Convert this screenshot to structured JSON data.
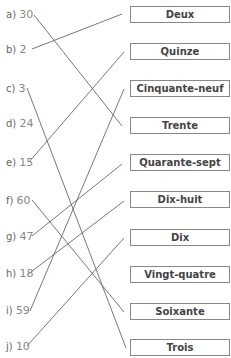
{
  "left_items": [
    {
      "label": "a)",
      "value": "30"
    },
    {
      "label": "b)",
      "value": "2"
    },
    {
      "label": "c)",
      "value": "3"
    },
    {
      "label": "d)",
      "value": "24"
    },
    {
      "label": "e)",
      "value": "15"
    },
    {
      "label": "f)",
      "value": "60"
    },
    {
      "label": "g)",
      "value": "47"
    },
    {
      "label": "h)",
      "value": "18"
    },
    {
      "label": "i)",
      "value": "59"
    },
    {
      "label": "j)",
      "value": "10"
    }
  ],
  "right_boxes": [
    "Deux",
    "Quinze",
    "Cinquante-neuf",
    "Trente",
    "Quarante-sept",
    "Dix-huit",
    "Dix",
    "Vingt-quatre",
    "Soixante",
    "Trois"
  ],
  "connections": [
    {
      "from": "a",
      "to": "Trente"
    },
    {
      "from": "b",
      "to": "Deux"
    },
    {
      "from": "c",
      "to": "Trois"
    },
    {
      "from": "e",
      "to": "Quinze"
    },
    {
      "from": "f",
      "to": "Soixante"
    },
    {
      "from": "g",
      "to": "Quarante-sept"
    },
    {
      "from": "h",
      "to": "Dix-huit"
    },
    {
      "from": "i",
      "to": "Cinquante-neuf"
    },
    {
      "from": "j",
      "to": "Dix"
    }
  ],
  "colors": {
    "line": "#555555",
    "box_border": "#888888",
    "text": "#444444"
  }
}
